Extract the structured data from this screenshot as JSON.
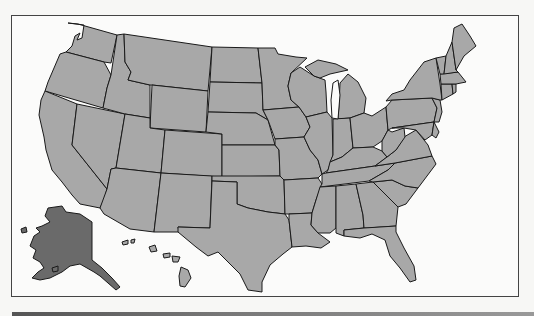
{
  "map": {
    "title": "",
    "region": "United States",
    "colors": {
      "default_fill": "#a8a8a8",
      "highlight_fill": "#6a6a6a",
      "border": "#1a1a1a",
      "background": "#fbfbfa"
    },
    "highlighted_states": [
      "Alaska"
    ],
    "insets": [
      "Alaska",
      "Hawaii"
    ]
  }
}
